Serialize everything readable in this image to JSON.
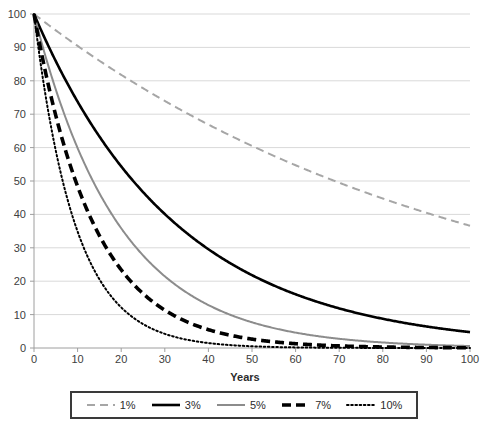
{
  "chart_data": {
    "type": "line",
    "title": "",
    "subtitle": "",
    "xlabel": "Years",
    "ylabel": "",
    "xlim": [
      0,
      100
    ],
    "ylim": [
      0,
      100
    ],
    "xticks": [
      0,
      10,
      20,
      30,
      40,
      50,
      60,
      70,
      80,
      90,
      100
    ],
    "yticks": [
      0,
      10,
      20,
      30,
      40,
      50,
      60,
      70,
      80,
      90,
      100
    ],
    "grid": "horizontal-only",
    "legend_position": "below-plot-boxed",
    "x": [
      0,
      5,
      10,
      15,
      20,
      25,
      30,
      35,
      40,
      45,
      50,
      55,
      60,
      65,
      70,
      75,
      80,
      85,
      90,
      95,
      100
    ],
    "series": [
      {
        "name": "1%",
        "rate": 0.01,
        "color": "#a6a6a6",
        "style": "dashed",
        "width": 2,
        "values": [
          100.0,
          95.1,
          90.4,
          86.0,
          81.8,
          77.8,
          74.0,
          70.3,
          66.9,
          63.6,
          60.5,
          57.5,
          54.7,
          52.0,
          49.5,
          47.0,
          44.7,
          42.5,
          40.5,
          38.5,
          36.6
        ]
      },
      {
        "name": "3%",
        "rate": 0.03,
        "color": "#000000",
        "style": "solid",
        "width": 2.6,
        "values": [
          100.0,
          85.9,
          73.7,
          63.3,
          54.4,
          46.7,
          40.1,
          34.4,
          29.6,
          25.4,
          21.8,
          18.7,
          16.1,
          13.8,
          11.9,
          10.2,
          8.8,
          7.5,
          6.5,
          5.5,
          4.8
        ]
      },
      {
        "name": "5%",
        "rate": 0.05,
        "color": "#8c8c8c",
        "style": "solid",
        "width": 2,
        "values": [
          100.0,
          77.4,
          59.9,
          46.3,
          35.8,
          27.7,
          21.5,
          16.6,
          12.9,
          9.9,
          7.7,
          6.0,
          4.6,
          3.6,
          2.8,
          2.1,
          1.7,
          1.3,
          1.0,
          0.8,
          0.6
        ]
      },
      {
        "name": "7%",
        "rate": 0.07,
        "color": "#000000",
        "style": "thick-dashed",
        "width": 3.6,
        "values": [
          100.0,
          69.6,
          48.4,
          33.7,
          23.4,
          16.3,
          11.3,
          7.9,
          5.5,
          3.8,
          2.7,
          1.8,
          1.3,
          0.9,
          0.6,
          0.4,
          0.3,
          0.2,
          0.1,
          0.1,
          0.1
        ]
      },
      {
        "name": "10%",
        "rate": 0.1,
        "color": "#000000",
        "style": "dotted",
        "width": 2,
        "values": [
          100.0,
          59.0,
          34.9,
          20.6,
          12.2,
          7.2,
          4.2,
          2.5,
          1.5,
          0.9,
          0.5,
          0.3,
          0.2,
          0.1,
          0.1,
          0.0,
          0.0,
          0.0,
          0.0,
          0.0,
          0.0
        ]
      }
    ]
  },
  "axis": {
    "x_title": "Years",
    "x_tick_labels": [
      "0",
      "10",
      "20",
      "30",
      "40",
      "50",
      "60",
      "70",
      "80",
      "90",
      "100"
    ],
    "y_tick_labels": [
      "0",
      "10",
      "20",
      "30",
      "40",
      "50",
      "60",
      "70",
      "80",
      "90",
      "100"
    ]
  },
  "legend": {
    "items": [
      {
        "label": "1%"
      },
      {
        "label": "3%"
      },
      {
        "label": "5%"
      },
      {
        "label": "7%"
      },
      {
        "label": "10%"
      }
    ]
  },
  "colors": {
    "gridline": "#d9d9d9",
    "axis": "#9e9e9e",
    "tick_text": "#404040",
    "legend_border": "#3a3a3a",
    "plot_background": "#ffffff"
  }
}
